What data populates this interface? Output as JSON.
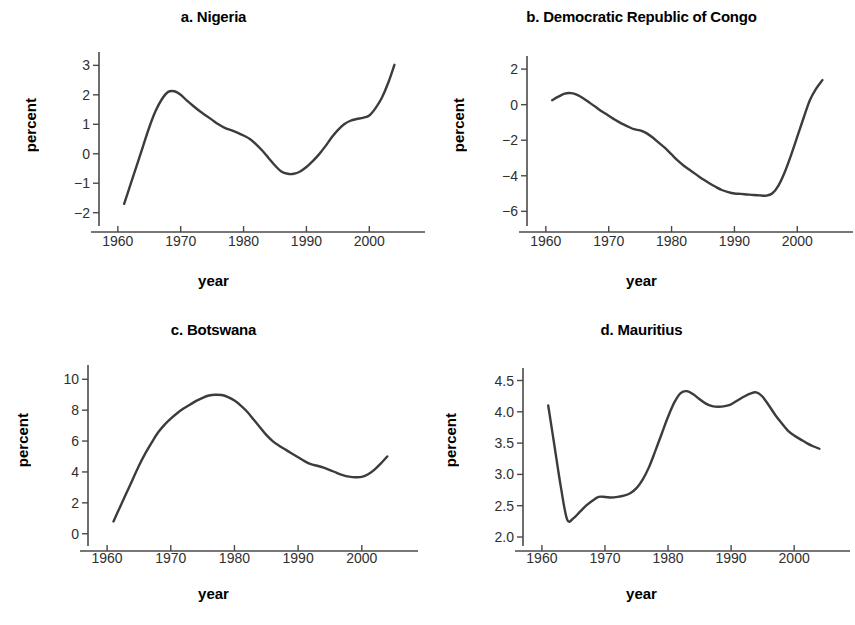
{
  "figure": {
    "background": "#ffffff",
    "line_color": "#3c3c3c",
    "axis_color": "#4a4a4a",
    "panel_count": 4
  },
  "chart_data": [
    {
      "type": "line",
      "panel": "a",
      "title": "a. Nigeria",
      "xlabel": "year",
      "ylabel": "percent",
      "xlim": [
        1957,
        2006
      ],
      "ylim": [
        -2.35,
        3.25
      ],
      "xticks": [
        1960,
        1970,
        1980,
        1990,
        2000
      ],
      "yticks": [
        -2,
        -1,
        0,
        1,
        2,
        3
      ],
      "ytick_labels": [
        "−2",
        "−1",
        "0",
        "1",
        "2",
        "3"
      ],
      "xtick_labels": [
        "1960",
        "1970",
        "1980",
        "1990",
        "2000"
      ],
      "grid": false,
      "legend": "none",
      "x": [
        1961,
        1962,
        1963,
        1964,
        1965,
        1966,
        1967,
        1968,
        1969,
        1970,
        1971,
        1972,
        1973,
        1974,
        1975,
        1976,
        1977,
        1978,
        1979,
        1980,
        1981,
        1982,
        1983,
        1984,
        1985,
        1986,
        1987,
        1988,
        1989,
        1990,
        1991,
        1992,
        1993,
        1994,
        1995,
        1996,
        1997,
        1998,
        1999,
        2000,
        2001,
        2002,
        2003,
        2004
      ],
      "values": [
        -1.7,
        -1.05,
        -0.4,
        0.25,
        0.9,
        1.45,
        1.85,
        2.1,
        2.12,
        2.0,
        1.8,
        1.62,
        1.45,
        1.3,
        1.15,
        1.0,
        0.88,
        0.8,
        0.72,
        0.62,
        0.5,
        0.32,
        0.1,
        -0.15,
        -0.4,
        -0.6,
        -0.68,
        -0.68,
        -0.6,
        -0.45,
        -0.25,
        -0.02,
        0.25,
        0.55,
        0.8,
        1.0,
        1.12,
        1.18,
        1.22,
        1.3,
        1.55,
        1.9,
        2.4,
        3.02
      ]
    },
    {
      "type": "line",
      "panel": "b",
      "title": "b. Democratic Republic of Congo",
      "xlabel": "year",
      "ylabel": "percent",
      "xlim": [
        1957,
        2006
      ],
      "ylim": [
        -6.6,
        2.4
      ],
      "xticks": [
        1960,
        1970,
        1980,
        1990,
        2000
      ],
      "yticks": [
        -6,
        -4,
        -2,
        0,
        2
      ],
      "ytick_labels": [
        "−6",
        "−4",
        "−2",
        "0",
        "2"
      ],
      "xtick_labels": [
        "1960",
        "1970",
        "1980",
        "1990",
        "2000"
      ],
      "grid": false,
      "legend": "none",
      "x": [
        1961,
        1962,
        1963,
        1964,
        1965,
        1966,
        1967,
        1968,
        1969,
        1970,
        1971,
        1972,
        1973,
        1974,
        1975,
        1976,
        1977,
        1978,
        1979,
        1980,
        1981,
        1982,
        1983,
        1984,
        1985,
        1986,
        1987,
        1988,
        1989,
        1990,
        1991,
        1992,
        1993,
        1994,
        1995,
        1996,
        1997,
        1998,
        1999,
        2000,
        2001,
        2002,
        2003,
        2004
      ],
      "values": [
        0.25,
        0.45,
        0.62,
        0.65,
        0.55,
        0.35,
        0.1,
        -0.15,
        -0.4,
        -0.62,
        -0.85,
        -1.05,
        -1.22,
        -1.38,
        -1.45,
        -1.6,
        -1.85,
        -2.15,
        -2.45,
        -2.8,
        -3.15,
        -3.45,
        -3.7,
        -3.95,
        -4.2,
        -4.42,
        -4.62,
        -4.8,
        -4.92,
        -5.0,
        -5.02,
        -5.05,
        -5.08,
        -5.1,
        -5.12,
        -5.0,
        -4.55,
        -3.8,
        -2.85,
        -1.8,
        -0.75,
        0.25,
        0.9,
        1.38
      ]
    },
    {
      "type": "line",
      "panel": "c",
      "title": "c. Botswana",
      "xlabel": "year",
      "ylabel": "percent",
      "xlim": [
        1957,
        2006
      ],
      "ylim": [
        -0.6,
        10.6
      ],
      "xticks": [
        1960,
        1970,
        1980,
        1990,
        2000
      ],
      "yticks": [
        0,
        2,
        4,
        6,
        8,
        10
      ],
      "ytick_labels": [
        "0",
        "2",
        "4",
        "6",
        "8",
        "10"
      ],
      "xtick_labels": [
        "1960",
        "1970",
        "1980",
        "1990",
        "2000"
      ],
      "grid": false,
      "legend": "none",
      "x": [
        1961,
        1962,
        1963,
        1964,
        1965,
        1966,
        1967,
        1968,
        1969,
        1970,
        1971,
        1972,
        1973,
        1974,
        1975,
        1976,
        1977,
        1978,
        1979,
        1980,
        1981,
        1982,
        1983,
        1984,
        1985,
        1986,
        1987,
        1988,
        1989,
        1990,
        1991,
        1992,
        1993,
        1994,
        1995,
        1996,
        1997,
        1998,
        1999,
        2000,
        2001,
        2002,
        2003,
        2004
      ],
      "values": [
        0.8,
        1.7,
        2.6,
        3.5,
        4.4,
        5.2,
        5.9,
        6.55,
        7.05,
        7.45,
        7.8,
        8.1,
        8.35,
        8.6,
        8.8,
        8.95,
        9.0,
        8.98,
        8.85,
        8.62,
        8.3,
        7.9,
        7.4,
        6.9,
        6.4,
        6.0,
        5.7,
        5.45,
        5.2,
        4.95,
        4.7,
        4.5,
        4.4,
        4.28,
        4.12,
        3.95,
        3.8,
        3.7,
        3.66,
        3.68,
        3.85,
        4.15,
        4.55,
        5.0
      ]
    },
    {
      "type": "line",
      "panel": "d",
      "title": "d. Mauritius",
      "xlabel": "year",
      "ylabel": "percent",
      "xlim": [
        1957,
        2006
      ],
      "ylim": [
        1.92,
        4.62
      ],
      "xticks": [
        1960,
        1970,
        1980,
        1990,
        2000
      ],
      "yticks": [
        2.0,
        2.5,
        3.0,
        3.5,
        4.0,
        4.5
      ],
      "ytick_labels": [
        "2.0",
        "2.5",
        "3.0",
        "3.5",
        "4.0",
        "4.5"
      ],
      "xtick_labels": [
        "1960",
        "1970",
        "1980",
        "1990",
        "2000"
      ],
      "grid": false,
      "legend": "none",
      "x": [
        1961,
        1962,
        1963,
        1964,
        1965,
        1966,
        1967,
        1968,
        1969,
        1970,
        1971,
        1972,
        1973,
        1974,
        1975,
        1976,
        1977,
        1978,
        1979,
        1980,
        1981,
        1982,
        1983,
        1984,
        1985,
        1986,
        1987,
        1988,
        1989,
        1990,
        1991,
        1992,
        1993,
        1994,
        1995,
        1996,
        1997,
        1998,
        1999,
        2000,
        2001,
        2002,
        2003,
        2004
      ],
      "values": [
        4.1,
        3.45,
        2.8,
        2.28,
        2.3,
        2.4,
        2.5,
        2.58,
        2.64,
        2.64,
        2.63,
        2.64,
        2.66,
        2.7,
        2.78,
        2.92,
        3.12,
        3.38,
        3.65,
        3.92,
        4.15,
        4.3,
        4.33,
        4.28,
        4.2,
        4.13,
        4.09,
        4.08,
        4.09,
        4.12,
        4.18,
        4.24,
        4.29,
        4.31,
        4.24,
        4.1,
        3.95,
        3.82,
        3.7,
        3.62,
        3.56,
        3.5,
        3.45,
        3.41
      ]
    }
  ]
}
